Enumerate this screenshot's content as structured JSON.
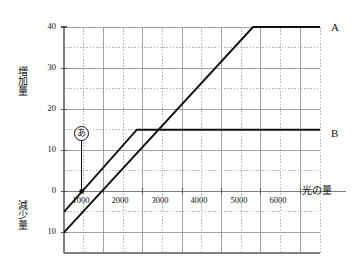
{
  "chart_data": {
    "type": "line",
    "title": "",
    "xlabel": "光の量",
    "ylabel_top": "増加量",
    "ylabel_bottom": "減少量",
    "grid": true,
    "legend_position": "right-inline",
    "xlim": [
      0,
      6500
    ],
    "ylim": [
      -15,
      40
    ],
    "x_ticks": [
      1000,
      2000,
      3000,
      4000,
      5000,
      6000
    ],
    "x_tick_labels": [
      "1000",
      "2000",
      "3000",
      "4000",
      "5000",
      "6000"
    ],
    "y_ticks": [
      40,
      30,
      20,
      10,
      0,
      -10
    ],
    "y_tick_labels": [
      "40",
      "30",
      "20",
      "10",
      "0",
      "10"
    ],
    "minor_grid_x": [
      500,
      1500,
      2500,
      3500,
      4500,
      5500,
      6500
    ],
    "minor_grid_y": [
      35,
      25,
      15,
      5,
      -5,
      -15
    ],
    "series": [
      {
        "name": "A",
        "label": "A",
        "points": [
          [
            0,
            -10
          ],
          [
            4800,
            40
          ],
          [
            6500,
            40
          ]
        ]
      },
      {
        "name": "B",
        "label": "B",
        "points": [
          [
            0,
            -5
          ],
          [
            1850,
            15
          ],
          [
            6500,
            15
          ]
        ]
      }
    ],
    "annotations": [
      {
        "name": "あ",
        "label": "あ",
        "marker_point": [
          450,
          0
        ],
        "leader_from": [
          450,
          14
        ],
        "leader_to": [
          450,
          0
        ]
      }
    ]
  },
  "axis_titles": {
    "x": "光の量",
    "y_top": "増加量",
    "y_bottom": "減少量"
  },
  "series_labels": {
    "a": "A",
    "b": "B"
  },
  "annotation": {
    "a_mark": "あ"
  },
  "colors": {
    "line": "#111111",
    "axis": "#808080",
    "major_grid": "#999999",
    "minor_grid": "#aaaaaa",
    "background": "#ffffff"
  }
}
